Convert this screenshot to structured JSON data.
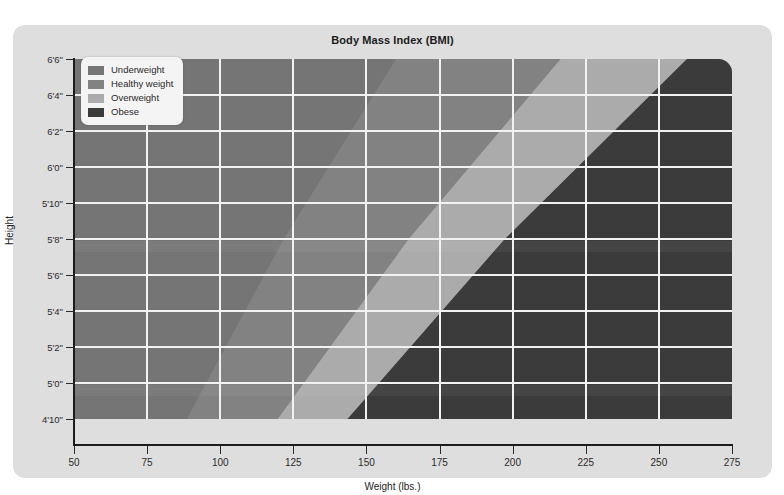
{
  "chart_data": {
    "type": "area",
    "title": "Body Mass Index (BMI)",
    "xlabel": "Weight (lbs.)",
    "ylabel": "Height",
    "xlim": [
      50,
      275
    ],
    "ylim_inches": [
      58,
      78
    ],
    "xticks": [
      "50",
      "75",
      "100",
      "125",
      "150",
      "175",
      "200",
      "225",
      "250",
      "275"
    ],
    "xtick_values": [
      50,
      75,
      100,
      125,
      150,
      175,
      200,
      225,
      250,
      275
    ],
    "yticks": [
      "6'6\"",
      "6'4\"",
      "6'2\"",
      "6'0\"",
      "5'10\"",
      "5'8\"",
      "5'6\"",
      "5'4\"",
      "5'2\"",
      "5'0\"",
      "4'10\""
    ],
    "ytick_inches": [
      78,
      76,
      74,
      72,
      70,
      68,
      66,
      64,
      62,
      60,
      58
    ],
    "grid": true,
    "legend_position": "top-left",
    "categories": [
      "Underweight",
      "Healthy weight",
      "Overweight",
      "Obese"
    ],
    "bmi_thresholds": [
      18.5,
      25,
      30
    ],
    "series": [
      {
        "name": "Underweight",
        "bmi_range": "below 18.5",
        "color": "#757575",
        "boundary_weights_lbs": {
          "at_4ft10in": 89,
          "at_6ft6in": 0
        }
      },
      {
        "name": "Healthy weight",
        "bmi_range": "18.5 to 24.9",
        "color": "#828282",
        "boundary_weights_lbs": {
          "at_4ft10in": 119,
          "at_6ft6in": 155
        }
      },
      {
        "name": "Overweight",
        "bmi_range": "25 to 29.9",
        "color": "#ababab",
        "boundary_weights_lbs": {
          "at_4ft10in": 143,
          "at_6ft6in": 255
        }
      },
      {
        "name": "Obese",
        "bmi_range": "30 and above",
        "color": "#3b3b3b",
        "boundary_weights_lbs": {
          "at_4ft10in": 143,
          "at_6ft6in": 255
        }
      }
    ]
  },
  "chart": {
    "title": "Body Mass Index (BMI)",
    "axis_x_title": "Weight (lbs.)",
    "axis_y_title": "Height",
    "x_tick_labels": [
      "50",
      "75",
      "100",
      "125",
      "150",
      "175",
      "200",
      "225",
      "250",
      "275"
    ],
    "y_tick_labels": [
      "6'6\"",
      "6'4\"",
      "6'2\"",
      "6'0\"",
      "5'10\"",
      "5'8\"",
      "5'6\"",
      "5'4\"",
      "5'2\"",
      "5'0\"",
      "4'10\""
    ]
  },
  "legend": {
    "items": [
      {
        "label": "Underweight",
        "color": "#757575"
      },
      {
        "label": "Healthy weight",
        "color": "#828282"
      },
      {
        "label": "Overweight",
        "color": "#ababab"
      },
      {
        "label": "Obese",
        "color": "#3b3b3b"
      }
    ]
  },
  "colors": {
    "page_background": "#ffffff",
    "card_background": "#dedede",
    "gridline": "#f2f2f2",
    "axis": "#1c1c1c",
    "text": "#2b2b2b",
    "legend_background": "#f4f4f4"
  }
}
